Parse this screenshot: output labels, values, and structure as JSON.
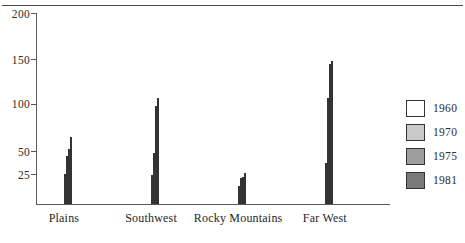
{
  "chart_data": {
    "type": "bar",
    "title": "",
    "subtitle": "",
    "xlabel": "",
    "ylabel": "",
    "categories": [
      "Plains",
      "Southwest",
      "Rocky Mountains",
      "Far West"
    ],
    "series": [
      {
        "name": "1960",
        "color": "#ffffff",
        "values": [
          25,
          24,
          15,
          38
        ]
      },
      {
        "name": "1970",
        "color": "#c9c9c9",
        "values": [
          57,
          61,
          22,
          108
        ]
      },
      {
        "name": "1975",
        "color": "#9e9e9e",
        "values": [
          65,
          99,
          23,
          145
        ]
      },
      {
        "name": "1981",
        "color": "#7a7a7a",
        "values": [
          81,
          108,
          26,
          149
        ]
      }
    ],
    "yticks": [
      25,
      50,
      100,
      150,
      200
    ],
    "ytick_labels": [
      "25",
      "50",
      "100",
      "150",
      "200"
    ],
    "ylim": [
      0,
      200
    ],
    "grid": false,
    "legend_position": "right",
    "legend_entries": [
      "1960",
      "1970",
      "1975",
      "1981"
    ]
  },
  "axis": {
    "ticks": [
      {
        "label": "200",
        "pos_pct": 100.0
      },
      {
        "label": "150",
        "pos_pct": 75.9
      },
      {
        "label": "100",
        "pos_pct": 52.4
      },
      {
        "label": "50",
        "pos_pct": 27.7
      },
      {
        "label": "25",
        "pos_pct": 15.7
      }
    ]
  },
  "groups": [
    {
      "label": "Plains",
      "left_pct": 7.9,
      "bars": [
        {
          "series": "1960",
          "value": 25,
          "height_pct": 15.7,
          "color": "#ffffff"
        },
        {
          "series": "1970",
          "value": 57,
          "height_pct": 25.1,
          "color": "#c9c9c9"
        },
        {
          "series": "1975",
          "value": 65,
          "height_pct": 28.8,
          "color": "#9e9e9e"
        },
        {
          "series": "1981",
          "value": 81,
          "height_pct": 35.1,
          "color": "#7a7a7a"
        }
      ]
    },
    {
      "label": "Southwest",
      "left_pct": 32.5,
      "bars": [
        {
          "series": "1960",
          "value": 24,
          "height_pct": 15.2,
          "color": "#ffffff"
        },
        {
          "series": "1970",
          "value": 61,
          "height_pct": 26.7,
          "color": "#c9c9c9"
        },
        {
          "series": "1975",
          "value": 99,
          "height_pct": 51.8,
          "color": "#9e9e9e"
        },
        {
          "series": "1981",
          "value": 108,
          "height_pct": 56.0,
          "color": "#7a7a7a"
        }
      ]
    },
    {
      "label": "Rocky Mountains",
      "left_pct": 57.1,
      "bars": [
        {
          "series": "1960",
          "value": 15,
          "height_pct": 9.4,
          "color": "#ffffff"
        },
        {
          "series": "1970",
          "value": 22,
          "height_pct": 13.6,
          "color": "#c9c9c9"
        },
        {
          "series": "1975",
          "value": 23,
          "height_pct": 14.1,
          "color": "#9e9e9e"
        },
        {
          "series": "1981",
          "value": 26,
          "height_pct": 16.2,
          "color": "#7a7a7a"
        }
      ]
    },
    {
      "label": "Far West",
      "left_pct": 81.6,
      "bars": [
        {
          "series": "1960",
          "value": 38,
          "height_pct": 21.5,
          "color": "#ffffff"
        },
        {
          "series": "1970",
          "value": 108,
          "height_pct": 56.0,
          "color": "#c9c9c9"
        },
        {
          "series": "1975",
          "value": 145,
          "height_pct": 73.8,
          "color": "#9e9e9e"
        },
        {
          "series": "1981",
          "value": 149,
          "height_pct": 75.4,
          "color": "#7a7a7a"
        }
      ]
    }
  ],
  "legend": {
    "items": [
      {
        "label": "1960",
        "color": "#ffffff"
      },
      {
        "label": "1970",
        "color": "#c9c9c9"
      },
      {
        "label": "1975",
        "color": "#9e9e9e"
      },
      {
        "label": "1981",
        "color": "#7a7a7a"
      }
    ]
  }
}
